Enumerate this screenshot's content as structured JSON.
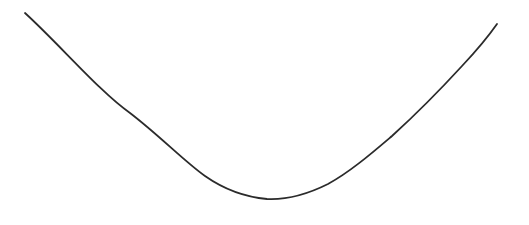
{
  "figure": {
    "title": "",
    "background_color": "#ffffff",
    "width": 529,
    "height": 225
  },
  "chart_data": {
    "type": "line",
    "title": "",
    "subtitle": "",
    "xlabel": "",
    "ylabel": "",
    "xlim": [
      0,
      529
    ],
    "ylim": [
      225,
      0
    ],
    "grid": false,
    "legend": null,
    "axes_visible": false,
    "tick_labels": {
      "x": [],
      "y": []
    },
    "annotations": [],
    "series": [
      {
        "name": "curve",
        "shape": "u-shaped-asymmetric-parabola",
        "stroke_color": "#2b2b2b",
        "stroke_width": 1.8,
        "vertex": {
          "x": 267,
          "y": 199
        },
        "start_point": {
          "x": 25,
          "y": 13
        },
        "end_point": {
          "x": 497,
          "y": 24
        },
        "left_slope": 0.95,
        "right_slope": -1.24,
        "x": [
          25,
          60,
          100,
          115,
          125,
          150,
          170,
          190,
          210,
          240,
          250,
          267,
          285,
          310,
          330,
          350,
          370,
          390,
          400,
          420,
          440,
          460,
          480,
          497
        ],
        "y": [
          13,
          44,
          90,
          98,
          108,
          133,
          152,
          165,
          177,
          192,
          194,
          199,
          198,
          192,
          182,
          172,
          158,
          145,
          138,
          117,
          93,
          70,
          45,
          24
        ],
        "path_d": "M 25 13 C 60 45, 100 92, 130 113 C 160 136, 185 162, 205 176 C 225 190, 245 197, 267 199 C 288 200, 308 194, 328 184 C 350 172, 372 153, 392 136 C 414 116, 440 90, 462 66 C 478 49, 490 34, 497 24"
      }
    ]
  }
}
